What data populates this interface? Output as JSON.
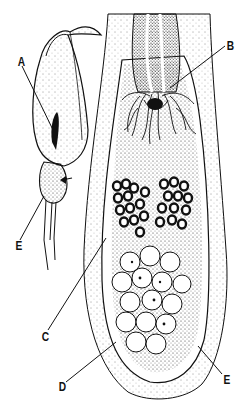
{
  "figure": {
    "type": "botanical-illustration",
    "ink_color": "#111111",
    "background": "#ffffff"
  },
  "labels": [
    {
      "id": "A",
      "text": "A",
      "x": 18,
      "y": 56,
      "target": "spadix inside spathe"
    },
    {
      "id": "B",
      "text": "B",
      "x": 227,
      "y": 40,
      "target": "hair-like sterile flowers (trap hairs)"
    },
    {
      "id": "C",
      "text": "C",
      "x": 42,
      "y": 333,
      "target": "male flowers (dark clusters)"
    },
    {
      "id": "D",
      "text": "D",
      "x": 59,
      "y": 383,
      "target": "female flowers (ovaries)"
    },
    {
      "id": "E_left",
      "text": "E",
      "x": 16,
      "y": 241,
      "target": "chamber at base of spathe (whole view)"
    },
    {
      "id": "E_right",
      "text": "E",
      "x": 223,
      "y": 377,
      "target": "chamber wall (section view)"
    }
  ]
}
